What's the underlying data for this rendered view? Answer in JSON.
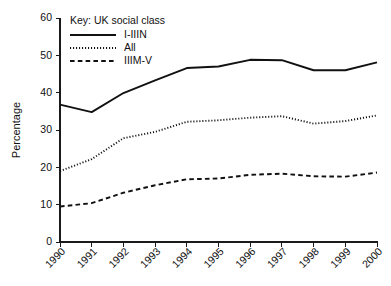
{
  "chart_data": {
    "type": "line",
    "title": "",
    "xlabel": "",
    "ylabel": "Percentage",
    "x": [
      1990,
      1991,
      1992,
      1993,
      1994,
      1995,
      1996,
      1997,
      1998,
      1999,
      2000
    ],
    "categories": [
      "1990",
      "1991",
      "1992",
      "1993",
      "1994",
      "1995",
      "1996",
      "1997",
      "1998",
      "1999",
      "2000"
    ],
    "xlim": [
      1990,
      2000
    ],
    "ylim": [
      0,
      60
    ],
    "yticks": [
      0,
      10,
      20,
      30,
      40,
      50,
      60
    ],
    "ytick_labels": [
      "0",
      "10",
      "20",
      "30",
      "40",
      "50",
      "60"
    ],
    "xtick_labels": [
      "1990",
      "1991",
      "1992",
      "1993",
      "1994",
      "1995",
      "1996",
      "1997",
      "1998",
      "1999",
      "2000"
    ],
    "grid": false,
    "legend_position": "top-left",
    "legend_title": "Key: UK social class",
    "series": [
      {
        "name": "I-IIIN",
        "style": "solid",
        "color": "#111111",
        "values": [
          36.8,
          34.8,
          39.9,
          43.3,
          46.6,
          47.0,
          48.8,
          48.7,
          46.0,
          46.0,
          48.1
        ]
      },
      {
        "name": "All",
        "style": "dotted",
        "color": "#111111",
        "values": [
          19.0,
          22.2,
          27.8,
          29.5,
          32.2,
          32.6,
          33.3,
          33.7,
          31.7,
          32.4,
          33.9
        ]
      },
      {
        "name": "IIIM-V",
        "style": "dashed",
        "color": "#111111",
        "values": [
          9.5,
          10.4,
          13.2,
          15.2,
          16.8,
          17.0,
          18.0,
          18.3,
          17.6,
          17.5,
          18.6
        ]
      }
    ]
  },
  "axes": {
    "y_axis_title": "Percentage"
  },
  "legend": {
    "title": "Key: UK social class",
    "entries": [
      {
        "label": "I-IIIN",
        "style": "solid"
      },
      {
        "label": "All",
        "style": "dotted"
      },
      {
        "label": "IIIM-V",
        "style": "dashed"
      }
    ]
  },
  "colors": {
    "ink": "#111111",
    "background": "#ffffff"
  }
}
